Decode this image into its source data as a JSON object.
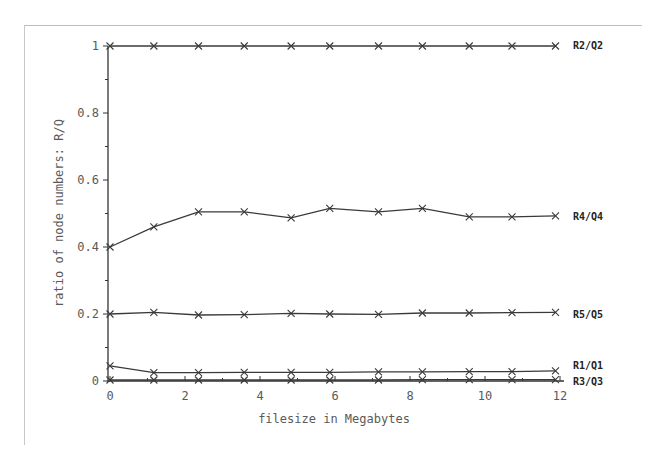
{
  "chart_data": {
    "type": "line",
    "title": "",
    "xlabel": "filesize in Megabytes",
    "ylabel": "ratio of node numbers: R/Q",
    "xlim": [
      0,
      12
    ],
    "ylim": [
      0,
      1
    ],
    "xticks": [
      0,
      2,
      4,
      6,
      8,
      10,
      12
    ],
    "yticks": [
      0,
      0.2,
      0.4,
      0.6,
      0.8,
      1
    ],
    "grid": false,
    "legend_position": "inline-right",
    "marker": "x",
    "x": [
      0,
      1.17,
      2.36,
      3.58,
      4.83,
      5.86,
      7.16,
      8.33,
      9.58,
      10.72,
      11.88
    ],
    "series": [
      {
        "name": "R2/Q2",
        "values": [
          1,
          1,
          1,
          1,
          1,
          1,
          1,
          1,
          1,
          1,
          1
        ]
      },
      {
        "name": "R4/Q4",
        "values": [
          0.4,
          0.46,
          0.505,
          0.505,
          0.487,
          0.515,
          0.505,
          0.515,
          0.49,
          0.49,
          0.493
        ]
      },
      {
        "name": "R5/Q5",
        "values": [
          0.2,
          0.205,
          0.197,
          0.198,
          0.202,
          0.2,
          0.199,
          0.203,
          0.203,
          0.204,
          0.205
        ]
      },
      {
        "name": "R1/Q1",
        "values": [
          0.045,
          0.025,
          0.025,
          0.026,
          0.026,
          0.026,
          0.027,
          0.027,
          0.028,
          0.028,
          0.03
        ]
      },
      {
        "name": "R3/Q3",
        "values": [
          0.003,
          0.003,
          0.003,
          0.003,
          0.003,
          0.003,
          0.003,
          0.004,
          0.004,
          0.004,
          0.004
        ]
      }
    ]
  },
  "colors": {
    "line": "#3a3a3a",
    "axis": "#333333",
    "text": "#5a5a5a",
    "frame": "#c0c0c0"
  }
}
